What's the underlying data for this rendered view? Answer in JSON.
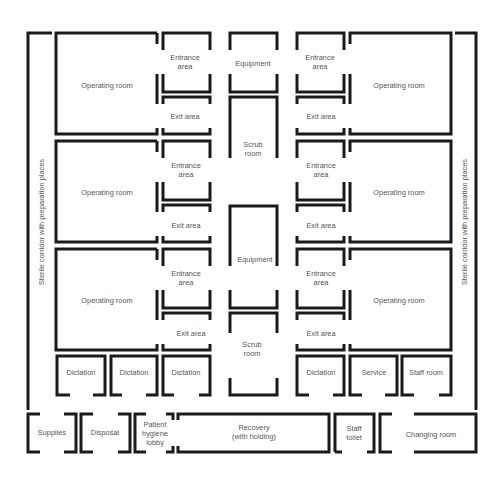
{
  "diagram": {
    "type": "floor-plan",
    "wall_color": "#1a1a1a",
    "label_color": "#555555",
    "corridors": {
      "left": "Sterile corridor with preparation places",
      "right": "Sterile corridor with preparation places"
    },
    "left_block": {
      "operating_rooms": [
        "Operating room",
        "Operating room",
        "Operating room"
      ],
      "entrance_areas": [
        "Entrance\narea",
        "Entrance\narea",
        "Entrance\narea"
      ],
      "exit_areas": [
        "Exit area",
        "Exit area",
        "Exit area"
      ]
    },
    "center_column": [
      "Equipment",
      "Scrub\nroom",
      "Equipment",
      "Scrub\nroom"
    ],
    "right_block": {
      "operating_rooms": [
        "Operating room",
        "Operating room",
        "Operating room"
      ],
      "entrance_areas": [
        "Entrance\narea",
        "Entrance\narea",
        "Entrance\narea"
      ],
      "exit_areas": [
        "Exit area",
        "Exit area",
        "Exit area"
      ]
    },
    "support_row_left": [
      "Dictation",
      "Dictation",
      "Dictation"
    ],
    "support_row_right": [
      "Dictation",
      "Service",
      "Staff room"
    ],
    "bottom_row": {
      "supplies": "Supplies",
      "disposal": "Disposal",
      "patient_hygiene_lobby": "Patient\nhygiene\nlobby",
      "recovery": "Recovery\n(with holding)",
      "staff_toilet": "Staff\ntoilet",
      "changing_room": "Changing room"
    }
  }
}
